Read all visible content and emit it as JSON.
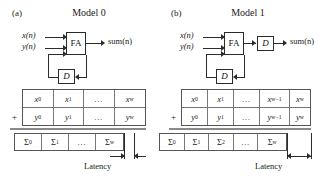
{
  "figure": {
    "panels": [
      {
        "tag": "(a)",
        "title": "Model 0",
        "diagram": {
          "input_x": "x(n)",
          "input_y": "y(n)",
          "adder_label": "FA",
          "feedback_register_label": "D",
          "output_label": "sum(n)",
          "output_register_label": ""
        },
        "operand_table": {
          "plus": "+",
          "row_x": [
            "x0",
            "x1",
            "...",
            "xw"
          ],
          "row_y": [
            "y0",
            "y1",
            "...",
            "yw"
          ],
          "row_x_display": [
            "x₀",
            "x₁",
            "…",
            "x_w"
          ],
          "row_y_display": [
            "y₀",
            "y₁",
            "…",
            "y_w"
          ]
        },
        "sum_table": {
          "cells": [
            "Σ0",
            "Σ1",
            "...",
            "Σw"
          ],
          "cells_display": [
            "Σ₀",
            "Σ₁",
            "…",
            "Σ_w"
          ]
        },
        "latency": {
          "label": "Latency",
          "cells_span": 1
        }
      },
      {
        "tag": "(b)",
        "title": "Model 1",
        "diagram": {
          "input_x": "x(n)",
          "input_y": "y(n)",
          "adder_label": "FA",
          "feedback_register_label": "D",
          "output_label": "sum(n)",
          "output_register_label": "D"
        },
        "operand_table": {
          "plus": "+",
          "row_x": [
            "x0",
            "x1",
            "...",
            "xw-1",
            "xw"
          ],
          "row_y": [
            "y0",
            "y1",
            "...",
            "yw-1",
            "yw"
          ],
          "row_x_display": [
            "x₀",
            "x₁",
            "…",
            "x_w−1",
            "x_w"
          ],
          "row_y_display": [
            "y₀",
            "y₁",
            "…",
            "y_w−1",
            "y_w"
          ]
        },
        "sum_table": {
          "cells": [
            "Σ0",
            "Σ1",
            "Σ2",
            "...",
            "Σw"
          ],
          "cells_display": [
            "Σ₀",
            "Σ₁",
            "Σ₂",
            "…",
            "Σ_w"
          ]
        },
        "latency": {
          "label": "Latency",
          "cells_span": 2
        }
      }
    ],
    "colors": {
      "stroke": "#2b2b2b",
      "table_border": "#555555",
      "table_grid": "#777777",
      "divider": "#8a8a8a",
      "background": "#ffffff",
      "text": "#1a1a1a"
    }
  }
}
